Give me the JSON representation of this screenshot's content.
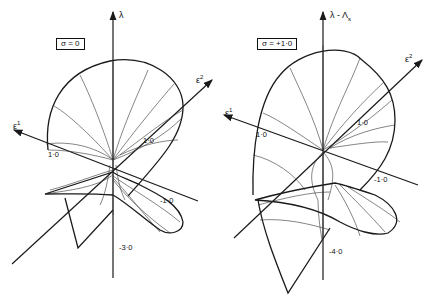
{
  "left_panel": {
    "param_label": "σ = 0",
    "vertical_axis_label": "λ",
    "axis_e1_label": "ε",
    "axis_e1_sup": "1",
    "axis_e2_label": "ε",
    "axis_e2_sup": "2",
    "ticks": {
      "e1_tick": "1·0",
      "e2_tick": "1·0",
      "e1_neg_tick": "-1·0",
      "lambda_tick": "-3·0"
    }
  },
  "right_panel": {
    "param_label": "σ = +1·0",
    "vertical_axis_label": "λ - Λ",
    "vertical_axis_sub": "s",
    "axis_e1_label": "ε",
    "axis_e1_sup": "1",
    "axis_e2_label": "ε",
    "axis_e2_sup": "2",
    "ticks": {
      "e1_tick": "1·0",
      "e2_tick": "1·0",
      "e1_neg_tick": "-1·0",
      "lambda_tick": "-4·0"
    }
  },
  "colors": {
    "line": "#1a1a1a",
    "background": "#ffffff"
  }
}
